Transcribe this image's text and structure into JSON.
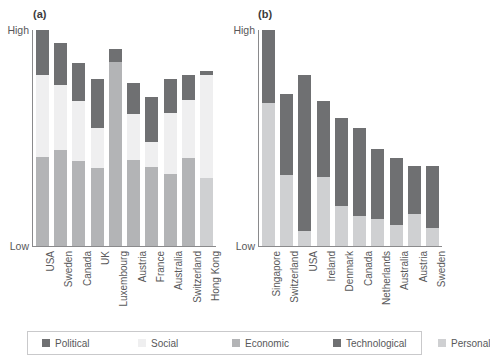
{
  "legend": {
    "items": [
      {
        "label": "Political",
        "color": "#6f7072"
      },
      {
        "label": "Social",
        "color": "#efeff0"
      },
      {
        "label": "Economic",
        "color": "#b3b4b6"
      },
      {
        "label": "Technological",
        "color": "#6f7072"
      },
      {
        "label": "Personal",
        "color": "#cfd0d2"
      }
    ]
  },
  "axis": {
    "high_label": "High",
    "low_label": "Low"
  },
  "panels": [
    {
      "key": "a",
      "label": "(a)"
    },
    {
      "key": "b",
      "label": "(b)"
    }
  ],
  "chart_data": [
    {
      "type": "bar",
      "panel": "(a)",
      "stacked": true,
      "title": "(a)",
      "xlabel": "",
      "ylabel": "",
      "ylim": [
        "Low",
        "High"
      ],
      "grid": false,
      "legend_position": "bottom",
      "categories": [
        "USA",
        "Sweden",
        "Canada",
        "UK",
        "Luxembourg",
        "Austria",
        "France",
        "Australia",
        "Switzerland",
        "Hong Kong"
      ],
      "series": [
        {
          "name": "Economic",
          "color": "#b3b4b6",
          "values": [
            41,
            46,
            43,
            41,
            100,
            46,
            44,
            38,
            46,
            0
          ]
        },
        {
          "name": "Personal",
          "color": "#cfd0d2",
          "values": [
            0,
            0,
            0,
            0,
            0,
            0,
            0,
            0,
            0,
            35
          ]
        },
        {
          "name": "Social",
          "color": "#efeff0",
          "values": [
            38,
            31,
            30,
            21,
            0,
            24,
            14,
            32,
            30,
            53
          ]
        },
        {
          "name": "Political",
          "color": "#6f7072",
          "values": [
            21,
            20,
            19,
            26,
            7,
            17,
            25,
            18,
            13,
            2
          ]
        }
      ],
      "bar_totals": [
        100,
        97,
        92,
        88,
        91,
        87,
        83,
        88,
        89,
        90
      ]
    },
    {
      "type": "bar",
      "panel": "(b)",
      "stacked": true,
      "title": "(b)",
      "xlabel": "",
      "ylabel": "",
      "ylim": [
        "Low",
        "High"
      ],
      "grid": false,
      "legend_position": "bottom",
      "categories": [
        "Singapore",
        "Switzerland",
        "USA",
        "Ireland",
        "Denmark",
        "Canada",
        "Netherlands",
        "Australia",
        "Austria",
        "Sweden"
      ],
      "series": [
        {
          "name": "Personal",
          "color": "#cfd0d2",
          "values": [
            66,
            39,
            8,
            39,
            24,
            19,
            19,
            15,
            24,
            14
          ]
        },
        {
          "name": "Technological",
          "color": "#6f7072",
          "values": [
            34,
            45,
            81,
            43,
            53,
            55,
            48,
            49,
            37,
            47
          ]
        }
      ],
      "bar_totals": [
        100,
        84,
        89,
        82,
        77,
        74,
        67,
        64,
        61,
        61
      ]
    }
  ]
}
